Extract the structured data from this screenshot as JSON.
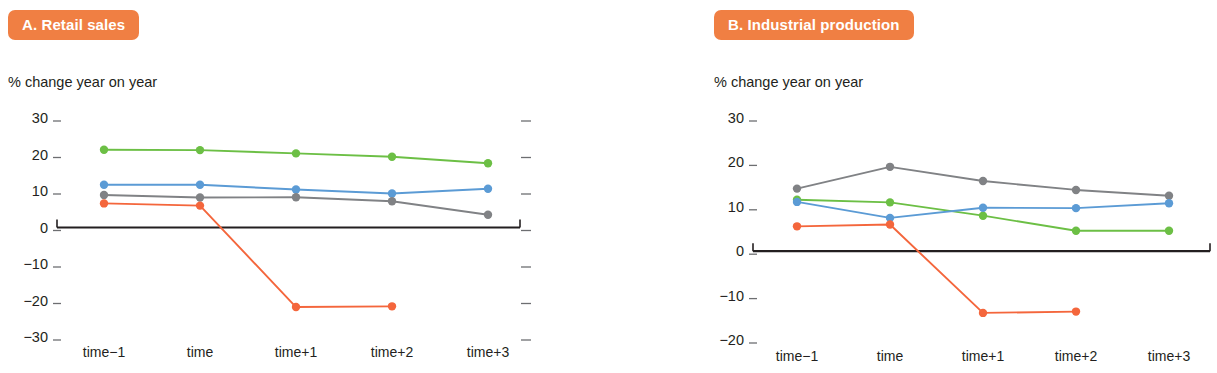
{
  "panels": [
    {
      "id": "retail-sales",
      "title": "A. Retail sales",
      "subtitle": "% change year on year"
    },
    {
      "id": "industrial-production",
      "title": "B. Industrial production",
      "subtitle": "% change year on year"
    }
  ],
  "colors": {
    "badge": "#f07f43",
    "green": "#6cbf45",
    "blue": "#5b9bd5",
    "gray": "#808285",
    "red": "#f4663c",
    "axis": "#231f20"
  },
  "chart_data": [
    {
      "type": "line",
      "title": "A. Retail sales",
      "subtitle": "% change year on year",
      "xlabel": "",
      "ylabel": "% change year on year",
      "categories": [
        "time−1",
        "time",
        "time+1",
        "time+2",
        "time+3"
      ],
      "ylim": [
        -30,
        30
      ],
      "yticks": [
        30,
        20,
        10,
        0,
        -10,
        -20,
        -30
      ],
      "ytick_labels": [
        "30",
        "20",
        "10",
        "0",
        "−10",
        "−20",
        "−30"
      ],
      "grid": false,
      "legend": "none",
      "zero_line": true,
      "series": [
        {
          "name": "green",
          "color": "#6cbf45",
          "values": [
            21.3,
            21.2,
            20.3,
            19.4,
            17.6
          ]
        },
        {
          "name": "blue",
          "color": "#5b9bd5",
          "values": [
            11.7,
            11.7,
            10.4,
            9.3,
            10.6
          ]
        },
        {
          "name": "gray",
          "color": "#808285",
          "values": [
            8.9,
            8.2,
            8.3,
            7.2,
            3.5
          ]
        },
        {
          "name": "red",
          "color": "#f4663c",
          "values": [
            6.6,
            6.0,
            -21.8,
            -21.6,
            null
          ]
        }
      ]
    },
    {
      "type": "line",
      "title": "B. Industrial production",
      "subtitle": "% change year on year",
      "xlabel": "",
      "ylabel": "% change year on year",
      "categories": [
        "time−1",
        "time",
        "time+1",
        "time+2",
        "time+3"
      ],
      "ylim": [
        -20,
        30
      ],
      "yticks": [
        30,
        20,
        10,
        0,
        -10,
        -20
      ],
      "ytick_labels": [
        "30",
        "20",
        "10",
        "0",
        "−10",
        "−20"
      ],
      "grid": false,
      "legend": "none",
      "zero_line": true,
      "series": [
        {
          "name": "gray",
          "color": "#808285",
          "values": [
            14.1,
            19.0,
            15.8,
            13.8,
            12.5
          ]
        },
        {
          "name": "green",
          "color": "#6cbf45",
          "values": [
            11.6,
            11.0,
            8.0,
            4.6,
            4.6
          ]
        },
        {
          "name": "blue",
          "color": "#5b9bd5",
          "values": [
            11.1,
            7.5,
            9.8,
            9.7,
            10.8
          ]
        },
        {
          "name": "red",
          "color": "#f4663c",
          "values": [
            5.6,
            6.0,
            -13.9,
            -13.6,
            null
          ]
        }
      ]
    }
  ]
}
